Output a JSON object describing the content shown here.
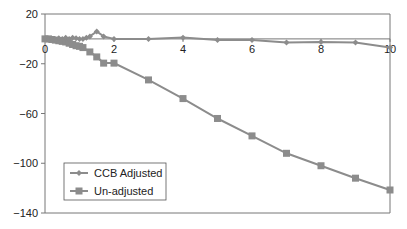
{
  "chart_data": {
    "type": "line",
    "title": "",
    "xlabel": "",
    "ylabel": "",
    "xlim": [
      0,
      10
    ],
    "ylim": [
      -140,
      20
    ],
    "x_ticks": [
      0,
      2,
      4,
      6,
      8,
      10
    ],
    "y_ticks": [
      20,
      -20,
      -60,
      -100,
      -140
    ],
    "y_tick_labels": [
      "20",
      "−20",
      "−60",
      "−100",
      "−140"
    ],
    "grid": false,
    "legend_position": "lower left",
    "series": [
      {
        "name": "CCB Adjusted",
        "marker": "diamond",
        "color": "#8c8c8c",
        "x": [
          0,
          0.1,
          0.2,
          0.3,
          0.4,
          0.5,
          0.6,
          0.7,
          0.8,
          0.9,
          1.0,
          1.1,
          1.2,
          1.3,
          1.5,
          1.7,
          2,
          3,
          4,
          5,
          6,
          7,
          8,
          9,
          10
        ],
        "y": [
          0,
          -0.5,
          0,
          -0.5,
          0.5,
          0,
          1,
          0,
          1,
          0.5,
          0,
          0,
          1,
          2,
          6,
          2,
          0,
          0,
          1,
          -1,
          -1,
          -3,
          -2.5,
          -3,
          -7
        ]
      },
      {
        "name": "Un-adjusted",
        "marker": "square",
        "color": "#8c8c8c",
        "x": [
          0,
          0.1,
          0.2,
          0.3,
          0.4,
          0.5,
          0.6,
          0.7,
          0.8,
          0.9,
          1.0,
          1.1,
          1.3,
          1.5,
          1.7,
          2,
          3,
          4,
          5,
          6,
          7,
          8,
          9,
          10
        ],
        "y": [
          0,
          0,
          -0.5,
          -1,
          -1.5,
          -2,
          -2.5,
          -3.5,
          -4.5,
          -5.5,
          -6,
          -7,
          -10.5,
          -14.5,
          -19.5,
          -19.5,
          -33,
          -48,
          -64,
          -78,
          -92,
          -102,
          -112,
          -121.5
        ]
      }
    ]
  },
  "legend": {
    "items": [
      {
        "label": "CCB Adjusted"
      },
      {
        "label": "Un-adjusted"
      }
    ]
  },
  "axes": {
    "x_tick_labels": [
      "0",
      "2",
      "4",
      "6",
      "8",
      "10"
    ],
    "y_tick_labels": [
      "20",
      "−20",
      "−60",
      "−100",
      "−140"
    ]
  }
}
